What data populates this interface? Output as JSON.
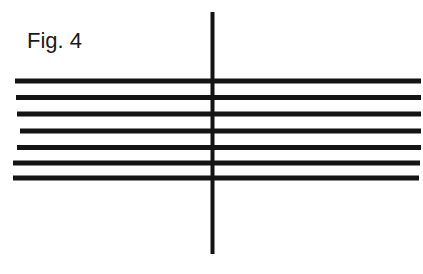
{
  "figure": {
    "label": "Fig. 4",
    "line_color": "#141414",
    "vertical_line": {
      "x": 212.5,
      "y1": 12,
      "y2": 254,
      "width": 4
    },
    "horizontal_lines": [
      {
        "x1": 15,
        "x2": 421,
        "y": 81,
        "width": 5
      },
      {
        "x1": 16,
        "x2": 421,
        "y": 97.5,
        "width": 5
      },
      {
        "x1": 17,
        "x2": 421,
        "y": 114,
        "width": 5
      },
      {
        "x1": 20,
        "x2": 421,
        "y": 131,
        "width": 5
      },
      {
        "x1": 17,
        "x2": 421,
        "y": 147.5,
        "width": 5
      },
      {
        "x1": 13,
        "x2": 420,
        "y": 163,
        "width": 5
      },
      {
        "x1": 13,
        "x2": 419,
        "y": 178,
        "width": 5
      }
    ]
  }
}
